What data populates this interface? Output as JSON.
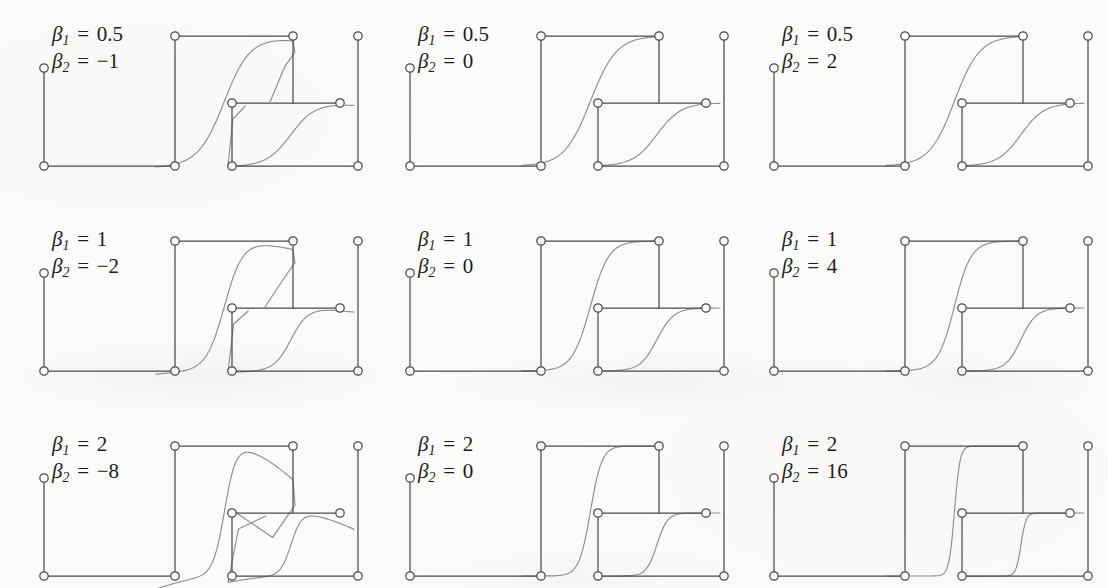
{
  "figure": {
    "kind": "multi-panel-curve-grid",
    "rows": 3,
    "cols": 3,
    "background_color": "#fbfbf9",
    "line_color": "#4a4a4a",
    "curve_color": "#8e8e8e",
    "marker_fill": "#fbfbf9",
    "marker_stroke": "#4a4a4a",
    "beta1_symbol": "β",
    "beta1_sub": "1",
    "beta2_symbol": "β",
    "beta2_sub": "2",
    "equals": "="
  },
  "chart_data": {
    "type": "line",
    "title": "",
    "subtitle": "",
    "xlabel": "",
    "ylabel": "",
    "grid": false,
    "legend": "none",
    "xlim": [
      0,
      1
    ],
    "ylim": [
      0,
      1
    ],
    "panels": [
      {
        "row": 0,
        "col": 0,
        "beta1": 0.5,
        "beta2": -1,
        "beta1_text": "0.5",
        "beta2_text": "−1",
        "main_curve": {
          "steepness": 0.5,
          "overshoot": -1,
          "shape": "s-curve rising, peaks then dips back toward right edge"
        },
        "inset_curve": {
          "steepness": 0.5,
          "overshoot": -1,
          "shape": "bulge left then sweep up to upper right"
        }
      },
      {
        "row": 0,
        "col": 1,
        "beta1": 0.5,
        "beta2": 0,
        "beta1_text": "0.5",
        "beta2_text": "0",
        "main_curve": {
          "steepness": 0.5,
          "overshoot": 0,
          "shape": "monotone s-curve rising to top right"
        },
        "inset_curve": {
          "steepness": 0.5,
          "overshoot": 0,
          "shape": "monotone s-curve rising to right"
        }
      },
      {
        "row": 0,
        "col": 2,
        "beta1": 0.5,
        "beta2": 2,
        "beta1_text": "0.5",
        "beta2_text": "2",
        "main_curve": {
          "steepness": 0.5,
          "overshoot": 2,
          "shape": "sharp rise, flat plateau along top"
        },
        "inset_curve": {
          "steepness": 0.5,
          "overshoot": 2,
          "shape": "flat along bottom, sharp rise at right"
        }
      },
      {
        "row": 1,
        "col": 0,
        "beta1": 1,
        "beta2": -2,
        "beta1_text": "1",
        "beta2_text": "−2",
        "main_curve": {
          "steepness": 1,
          "overshoot": -2,
          "shape": "steeper s-curve with pronounced return hook at right"
        },
        "inset_curve": {
          "steepness": 1,
          "overshoot": -2,
          "shape": "deep left bulge then rise to upper right"
        }
      },
      {
        "row": 1,
        "col": 1,
        "beta1": 1,
        "beta2": 0,
        "beta1_text": "1",
        "beta2_text": "0",
        "main_curve": {
          "steepness": 1,
          "overshoot": 0,
          "shape": "monotone steeper s-curve"
        },
        "inset_curve": {
          "steepness": 1,
          "overshoot": 0,
          "shape": "monotone steeper s-curve"
        }
      },
      {
        "row": 1,
        "col": 2,
        "beta1": 1,
        "beta2": 4,
        "beta1_text": "1",
        "beta2_text": "4",
        "main_curve": {
          "steepness": 1,
          "overshoot": 4,
          "shape": "very sharp rise, long top plateau"
        },
        "inset_curve": {
          "steepness": 1,
          "overshoot": 4,
          "shape": "long bottom plateau, very sharp rise at right"
        }
      },
      {
        "row": 2,
        "col": 0,
        "beta1": 2,
        "beta2": -8,
        "beta1_text": "2",
        "beta2_text": "−8",
        "main_curve": {
          "steepness": 2,
          "overshoot": -8,
          "shape": "dip below then steep rise, strong fold back at right"
        },
        "inset_curve": {
          "steepness": 2,
          "overshoot": -8,
          "shape": "strong left fold, shallow rise to right"
        }
      },
      {
        "row": 2,
        "col": 1,
        "beta1": 2,
        "beta2": 0,
        "beta1_text": "2",
        "beta2_text": "0",
        "main_curve": {
          "steepness": 2,
          "overshoot": 0,
          "shape": "monotone steep s-curve"
        },
        "inset_curve": {
          "steepness": 2,
          "overshoot": 0,
          "shape": "monotone steep s-curve"
        }
      },
      {
        "row": 2,
        "col": 2,
        "beta1": 2,
        "beta2": 16,
        "beta1_text": "2",
        "beta2_text": "16",
        "main_curve": {
          "steepness": 2,
          "overshoot": 16,
          "shape": "near-step rise, square top plateau"
        },
        "inset_curve": {
          "steepness": 2,
          "overshoot": 16,
          "shape": "near-step, square bottom plateau"
        }
      }
    ]
  }
}
